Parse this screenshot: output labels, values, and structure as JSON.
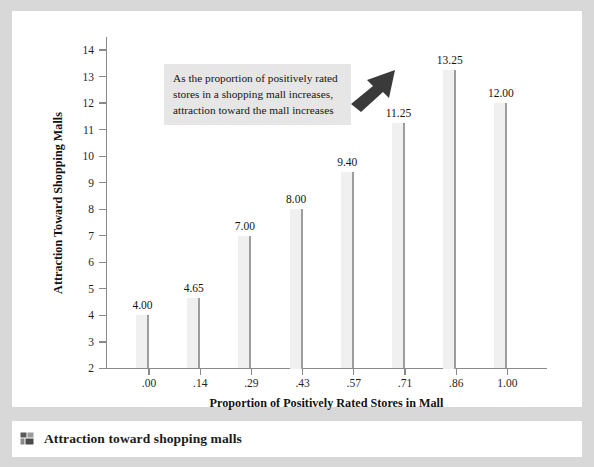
{
  "caption": {
    "icon": "thumbnail-icon",
    "text": "Attraction toward shopping malls"
  },
  "annotation": {
    "line1": "As the proportion of positively rated",
    "line2": "stores in a shopping mall increases,",
    "line3": "attraction toward the mall increases",
    "arrow": "arrow-up-right-icon"
  },
  "colors": {
    "frame": "#d8d8d8",
    "panel": "#ffffff",
    "bar_fill": "#f0f0f0",
    "bar_edge": "#9d9d9d",
    "axis": "#8a8a8a",
    "annotation_bg": "#e6e6e6",
    "arrow": "#3a3a3a"
  },
  "chart_data": {
    "type": "bar",
    "title": "",
    "xlabel": "Proportion of Positively Rated Stores in Mall",
    "ylabel": "Attraction Toward Shopping Malls",
    "categories": [
      ".00",
      ".14",
      ".29",
      ".43",
      ".57",
      ".71",
      ".86",
      "1.00"
    ],
    "values": [
      4.0,
      4.65,
      7.0,
      8.0,
      9.4,
      11.25,
      13.25,
      12.0
    ],
    "value_labels": [
      "4.00",
      "4.65",
      "7.00",
      "8.00",
      "9.40",
      "11.25",
      "13.25",
      "12.00"
    ],
    "ylim": [
      2,
      14
    ],
    "yticks": [
      2,
      3,
      4,
      5,
      6,
      7,
      8,
      9,
      10,
      11,
      12,
      13,
      14
    ],
    "ytick_labels": [
      "2",
      "3",
      "4",
      "5",
      "6",
      "7",
      "8",
      "9",
      "10",
      "11",
      "12",
      "13",
      "14"
    ],
    "grid": false,
    "legend": "none"
  }
}
